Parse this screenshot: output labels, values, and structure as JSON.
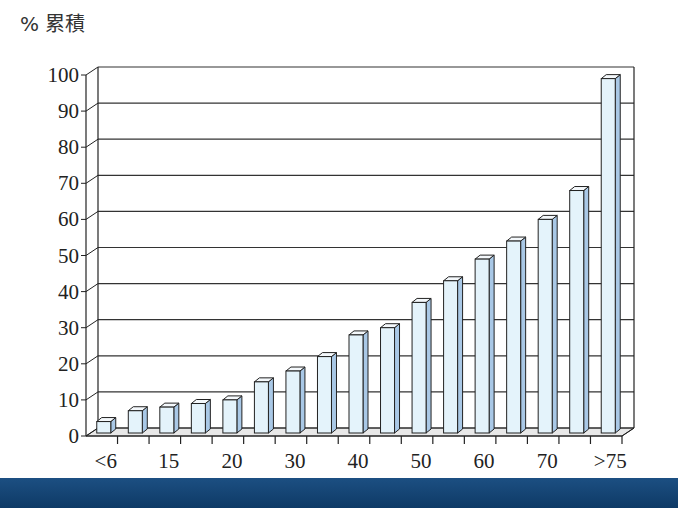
{
  "chart_data": {
    "type": "bar",
    "style": "3d-column",
    "title": "",
    "ylabel": "% 累積",
    "xlabel": "",
    "ylim": [
      0,
      100
    ],
    "yticks": [
      0,
      10,
      20,
      30,
      40,
      50,
      60,
      70,
      80,
      90,
      100
    ],
    "grid": true,
    "legend": null,
    "categories": [
      "<6",
      "",
      "15",
      "",
      "20",
      "",
      "30",
      "",
      "40",
      "",
      "50",
      "",
      "60",
      "",
      "70",
      "",
      ">75"
    ],
    "values": [
      4,
      7,
      8,
      9,
      10,
      15,
      18,
      22,
      28,
      30,
      37,
      43,
      49,
      54,
      60,
      68,
      99
    ],
    "bar_color": "#e4f3fb",
    "bar_side_color": "#a9c8e6"
  },
  "colors": {
    "axis": "#222222",
    "grid": "#333333",
    "floor": "#e8e8e8",
    "bottom_band": "#164a7c"
  }
}
